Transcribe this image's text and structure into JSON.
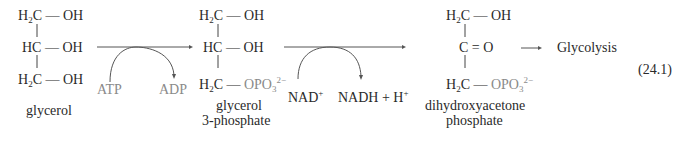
{
  "equation_number": "(24.1)",
  "molecules": [
    {
      "name": "glycerol",
      "label": "glycerol",
      "rows": [
        {
          "carbon": "H2C",
          "group": "OH"
        },
        {
          "carbon": "HC",
          "group": "OH"
        },
        {
          "carbon": "H2C",
          "group": "OH"
        }
      ]
    },
    {
      "name": "glycerol-3-phosphate",
      "label_line1": "glycerol",
      "label_line2": "3-phosphate",
      "rows": [
        {
          "carbon": "H2C",
          "group": "OH"
        },
        {
          "carbon": "HC",
          "group": "OH"
        },
        {
          "carbon": "H2C",
          "group": "OPO3 2−"
        }
      ]
    },
    {
      "name": "dihydroxyacetone-phosphate",
      "label_line1": "dihydroxyacetone",
      "label_line2": "phosphate",
      "rows": [
        {
          "carbon": "H2C",
          "group": "OH"
        },
        {
          "carbon": "C",
          "group": "O",
          "bond": "double"
        },
        {
          "carbon": "H2C",
          "group": "OPO3 2−"
        }
      ]
    }
  ],
  "reactions": [
    {
      "cofactor_in": "ATP",
      "cofactor_out": "ADP"
    },
    {
      "cofactor_in": "NAD+",
      "cofactor_out": "NADH + H+"
    }
  ],
  "product": "Glycolysis",
  "text": {
    "H": "H",
    "C": "C",
    "HC": "HC",
    "OH": "OH",
    "O": "O",
    "OPO": "OPO",
    "sub2": "2",
    "sub3": "3",
    "charge": "2−",
    "dash": "—",
    "dbl": "=",
    "plus_sup": "+",
    "atp": "ATP",
    "adp": "ADP",
    "nad": "NAD",
    "nadh": "NADH + H",
    "glycerol": "glycerol",
    "g3p_1": "glycerol",
    "g3p_2": "3-phosphate",
    "dhap_1": "dihydroxyacetone",
    "dhap_2": "phosphate",
    "glycolysis": "Glycolysis",
    "eqnum": "(24.1)"
  },
  "colors": {
    "text": "#2a2a2a",
    "phosphate_gray": "#8a8a8a",
    "arrow": "#555555"
  }
}
